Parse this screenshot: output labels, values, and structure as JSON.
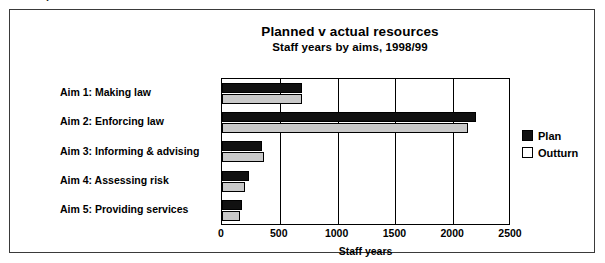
{
  "figure": {
    "title": "Planned v actual resources",
    "subtitle": "Staff years by aims, 1998/99"
  },
  "legend": {
    "position": "right",
    "entries": [
      {
        "label": "Plan",
        "key": "plan",
        "color": "#111111"
      },
      {
        "label": "Outturn",
        "key": "outturn",
        "color": "#ffffff"
      }
    ]
  },
  "axis": {
    "x_label": "Staff years",
    "ticks": [
      "0",
      "500",
      "1000",
      "1500",
      "2000",
      "2500"
    ]
  },
  "chart_data": {
    "type": "bar",
    "orientation": "horizontal",
    "title": "Planned v actual resources",
    "subtitle": "Staff years by aims, 1998/99",
    "xlabel": "Staff years",
    "ylabel": "",
    "xlim": [
      0,
      2500
    ],
    "xticks": [
      0,
      500,
      1000,
      1500,
      2000,
      2500
    ],
    "grid": true,
    "legend_position": "right",
    "categories": [
      "Aim 1: Making law",
      "Aim 2: Enforcing law",
      "Aim 3: Informing & advising",
      "Aim 4: Assessing risk",
      "Aim 5: Providing services"
    ],
    "series": [
      {
        "name": "Plan",
        "color": "#111111",
        "values": [
          690,
          2200,
          350,
          230,
          175
        ]
      },
      {
        "name": "Outturn",
        "color": "#c9c9c9",
        "values": [
          690,
          2130,
          360,
          195,
          160
        ]
      }
    ]
  },
  "artifact": {
    "top_clipped_text": "."
  }
}
